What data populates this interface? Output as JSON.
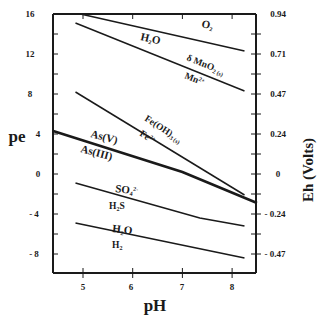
{
  "chart_data": {
    "type": "line",
    "title": "",
    "xlabel": "pH",
    "ylabel": "pe",
    "ylabel_right": "Eh (Volts)",
    "xlim": [
      4.4,
      8.5
    ],
    "ylim": [
      -10,
      16
    ],
    "x_ticks": [
      5,
      6,
      7,
      8
    ],
    "y_ticks": [
      16,
      12,
      8,
      4,
      0,
      -4,
      -8
    ],
    "y_right_ticks": [
      "0.94",
      "0.71",
      "0.47",
      "0.24",
      "0",
      "- 0.24",
      "- 0.47"
    ],
    "y_left_tick_labels": [
      "16",
      "12",
      "8",
      "4",
      "0",
      "- 4",
      "- 8"
    ],
    "grid": false,
    "legend": "none (inline labels)",
    "series": [
      {
        "name": "O2 / H2O",
        "upper_label": "O2",
        "lower_label": "H2O",
        "points": [
          [
            4.95,
            16.0
          ],
          [
            8.25,
            12.3
          ]
        ]
      },
      {
        "name": "δMnO2(s) / Mn2+",
        "upper_label": "δ MnO2(s)",
        "lower_label": "Mn2+",
        "points": [
          [
            4.85,
            15.1
          ],
          [
            8.25,
            8.3
          ]
        ]
      },
      {
        "name": "Fe(OH)3(s) / Fe2+",
        "upper_label": "Fe(OH)3(s)",
        "lower_label": "Fe2+",
        "points": [
          [
            4.85,
            8.2
          ],
          [
            8.25,
            -2.1
          ]
        ]
      },
      {
        "name": "As(V) / As(III)",
        "upper_label": "As(V)",
        "lower_label": "As(III)",
        "bold": true,
        "points": [
          [
            4.4,
            4.3
          ],
          [
            7.0,
            0.2
          ],
          [
            8.5,
            -2.9
          ]
        ]
      },
      {
        "name": "SO4 2- / H2S",
        "upper_label": "SO4 2-",
        "lower_label": "H2S",
        "points": [
          [
            4.85,
            -0.9
          ],
          [
            7.35,
            -4.4
          ],
          [
            8.25,
            -5.2
          ]
        ]
      },
      {
        "name": "H2O / H2",
        "upper_label": "H2O",
        "lower_label": "H2",
        "points": [
          [
            4.85,
            -4.9
          ],
          [
            8.25,
            -8.4
          ]
        ]
      }
    ]
  },
  "labels": {
    "x_title": "pH",
    "y_title": "pe",
    "y_right_title": "Eh (Volts)",
    "o2": "O",
    "o2_sub": "2",
    "h2o_a": "H",
    "h2o_a_sub": "2",
    "h2o_a_end": "O",
    "mno2": "δ MnO",
    "mno2_sub": "2 (s)",
    "mn2": "Mn",
    "mn2_sup": "2+",
    "feoh": "Fe(OH)",
    "feoh_sub": "3 (s)",
    "fe2": "Fe",
    "fe2_sup": "2+",
    "asv": "As(V)",
    "asiii": "As(III)",
    "so4": "SO",
    "so4_sub": "4",
    "so4_sup": "2-",
    "h2s": "H",
    "h2s_sub": "2",
    "h2s_end": "S",
    "h2o_b": "H",
    "h2o_b_sub": "2",
    "h2o_b_end": "O",
    "h2": "H",
    "h2_sub": "2"
  }
}
